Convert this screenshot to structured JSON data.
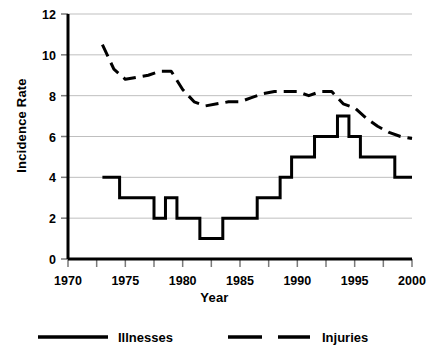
{
  "chart_data": {
    "type": "line",
    "title": "",
    "xlabel": "Year",
    "ylabel": "Incidence Rate",
    "xlim": [
      1970,
      2000
    ],
    "ylim": [
      0,
      12
    ],
    "xticks": [
      1970,
      1975,
      1980,
      1985,
      1990,
      1995,
      2000
    ],
    "xtick_labels": [
      "1970",
      "1975",
      "1980",
      "1985",
      "1990",
      "1995",
      "2000"
    ],
    "x_minor_tick_interval": 2.5,
    "yticks": [
      0,
      2,
      4,
      6,
      8,
      10,
      12
    ],
    "ytick_labels": [
      "0",
      "2",
      "4",
      "6",
      "8",
      "10",
      "12"
    ],
    "grid": "horizontal",
    "grid_color": "#bfbfbf",
    "legend_position": "bottom",
    "x": [
      1973,
      1974,
      1975,
      1976,
      1977,
      1978,
      1979,
      1980,
      1981,
      1982,
      1983,
      1984,
      1985,
      1986,
      1987,
      1988,
      1989,
      1990,
      1991,
      1992,
      1993,
      1994,
      1995,
      1996,
      1997,
      1998,
      1999,
      2000
    ],
    "series": [
      {
        "name": "Illnesses",
        "style": "solid",
        "color": "#000000",
        "values": [
          4,
          4,
          3,
          3,
          3,
          2,
          3,
          2,
          2,
          1,
          1,
          2,
          2,
          2,
          3,
          3,
          4,
          5,
          5,
          6,
          6,
          7,
          6,
          5,
          5,
          5,
          4,
          4
        ]
      },
      {
        "name": "Injuries",
        "style": "dashed",
        "color": "#000000",
        "values": [
          10.5,
          9.3,
          8.8,
          8.9,
          9.0,
          9.2,
          9.2,
          8.3,
          7.7,
          7.5,
          7.6,
          7.7,
          7.7,
          7.9,
          8.1,
          8.2,
          8.2,
          8.2,
          8.0,
          8.2,
          8.2,
          7.6,
          7.4,
          6.9,
          6.5,
          6.2,
          6.0,
          5.9
        ]
      }
    ]
  },
  "legend": {
    "items": [
      {
        "label": "Illnesses",
        "swatch": "solid-line-swatch"
      },
      {
        "label": "Injuries",
        "swatch": "dashed-line-swatch"
      }
    ]
  },
  "axes": {
    "y_title": "Incidence Rate",
    "x_title": "Year"
  }
}
